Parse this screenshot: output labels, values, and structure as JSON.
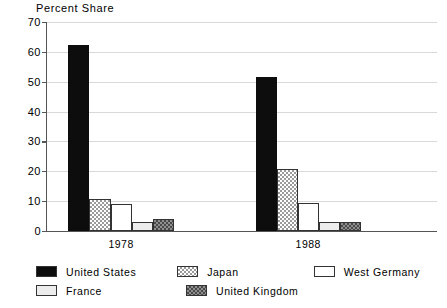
{
  "chart_data": {
    "type": "bar",
    "title": "Percent Share",
    "xlabel": "",
    "ylabel": "Percent Share",
    "ylim": [
      0,
      70
    ],
    "yticks": [
      0,
      10,
      20,
      30,
      40,
      50,
      60,
      70
    ],
    "ytick_labels": [
      "0",
      "10",
      "20",
      "30",
      "40",
      "50",
      "60",
      "70"
    ],
    "grid": true,
    "legend_position": "bottom",
    "categories": [
      "1978",
      "1988"
    ],
    "series": [
      {
        "name": "United States",
        "values": [
          62.3,
          51.6
        ],
        "swatch": "solid-black"
      },
      {
        "name": "Japan",
        "values": [
          10.8,
          20.9
        ],
        "swatch": "check-light"
      },
      {
        "name": "West Germany",
        "values": [
          9.0,
          9.4
        ],
        "swatch": "white"
      },
      {
        "name": "France",
        "values": [
          3.1,
          3.0
        ],
        "swatch": "light"
      },
      {
        "name": "United Kingdom",
        "values": [
          4.0,
          3.1
        ],
        "swatch": "check-dark"
      }
    ]
  },
  "legend": {
    "rows": [
      [
        {
          "label": "United States",
          "swatch": "solid-black"
        },
        {
          "label": "Japan",
          "swatch": "check-light"
        },
        {
          "label": "West Germany",
          "swatch": "white"
        }
      ],
      [
        {
          "label": "France",
          "swatch": "light"
        },
        {
          "label": "United Kingdom",
          "swatch": "check-dark"
        }
      ]
    ]
  },
  "colors": {
    "axis": "#555555",
    "grid": "#d9d9d9",
    "bar_outline": "#333333",
    "solid_black": "#0d0d0d",
    "light_gray": "#ececec",
    "check_light": "#9a9a9a",
    "check_dark": "#4a4a4a",
    "background": "#ffffff"
  }
}
